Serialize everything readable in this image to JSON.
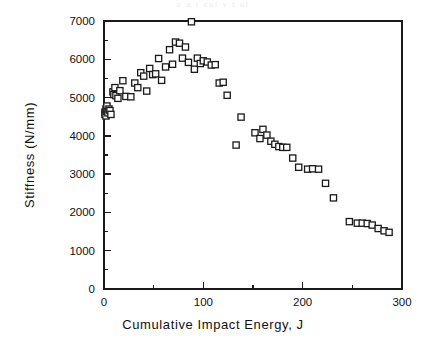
{
  "figure": {
    "top_artifact_text": "o        a                        t        cul v        t            ul",
    "background_color": "#ffffff",
    "frame_color": "#1a1a1a",
    "marker_fill": "#ffffff",
    "marker_edge": "#1a1a1a"
  },
  "chart_data": {
    "type": "scatter",
    "title": "",
    "subtitle": "",
    "xlabel": "Cumulative Impact Energy, J",
    "ylabel": "Stiffness  (N/mm)",
    "xlim": [
      0,
      300
    ],
    "ylim": [
      0,
      7000
    ],
    "xticks": [
      0,
      100,
      200,
      300
    ],
    "xtick_labels": [
      "0",
      "100",
      "200",
      "300"
    ],
    "xticks_minor": [
      50,
      150,
      250
    ],
    "yticks": [
      0,
      1000,
      2000,
      3000,
      4000,
      5000,
      6000,
      7000
    ],
    "ytick_labels": [
      "0",
      "1000",
      "2000",
      "3000",
      "4000",
      "5000",
      "6000",
      "7000"
    ],
    "yticks_minor": [
      500,
      1500,
      2500,
      3500,
      4500,
      5500,
      6500
    ],
    "grid": false,
    "legend": null,
    "marker": "open-square",
    "series": [
      {
        "name": "Stiffness vs cumulative impact energy",
        "points": [
          [
            1,
            4620
          ],
          [
            1,
            4560
          ],
          [
            2,
            4700
          ],
          [
            2,
            4520
          ],
          [
            3,
            4780
          ],
          [
            3,
            4640
          ],
          [
            4,
            4600
          ],
          [
            5,
            4700
          ],
          [
            6,
            4660
          ],
          [
            7,
            4560
          ],
          [
            9,
            5150
          ],
          [
            10,
            5080
          ],
          [
            11,
            5260
          ],
          [
            12,
            5050
          ],
          [
            14,
            4980
          ],
          [
            16,
            5180
          ],
          [
            19,
            5440
          ],
          [
            22,
            5030
          ],
          [
            27,
            5020
          ],
          [
            31,
            5380
          ],
          [
            34,
            5260
          ],
          [
            37,
            5650
          ],
          [
            40,
            5560
          ],
          [
            43,
            5170
          ],
          [
            46,
            5760
          ],
          [
            49,
            5600
          ],
          [
            52,
            5620
          ],
          [
            55,
            6020
          ],
          [
            58,
            5450
          ],
          [
            62,
            5800
          ],
          [
            66,
            6250
          ],
          [
            69,
            5870
          ],
          [
            72,
            6450
          ],
          [
            76,
            6420
          ],
          [
            79,
            6030
          ],
          [
            82,
            6320
          ],
          [
            85,
            5920
          ],
          [
            88,
            6980
          ],
          [
            91,
            5740
          ],
          [
            94,
            6030
          ],
          [
            97,
            5890
          ],
          [
            100,
            5960
          ],
          [
            104,
            5930
          ],
          [
            108,
            5850
          ],
          [
            112,
            5860
          ],
          [
            116,
            5380
          ],
          [
            120,
            5400
          ],
          [
            124,
            5060
          ],
          [
            133,
            3760
          ],
          [
            138,
            4490
          ],
          [
            152,
            4080
          ],
          [
            157,
            3930
          ],
          [
            160,
            4170
          ],
          [
            164,
            4020
          ],
          [
            168,
            3860
          ],
          [
            172,
            3780
          ],
          [
            176,
            3720
          ],
          [
            180,
            3700
          ],
          [
            184,
            3700
          ],
          [
            190,
            3420
          ],
          [
            196,
            3180
          ],
          [
            205,
            3130
          ],
          [
            210,
            3140
          ],
          [
            216,
            3130
          ],
          [
            223,
            2760
          ],
          [
            231,
            2380
          ],
          [
            247,
            1760
          ],
          [
            255,
            1720
          ],
          [
            260,
            1720
          ],
          [
            265,
            1710
          ],
          [
            270,
            1670
          ],
          [
            276,
            1580
          ],
          [
            282,
            1520
          ],
          [
            287,
            1480
          ]
        ]
      }
    ]
  }
}
